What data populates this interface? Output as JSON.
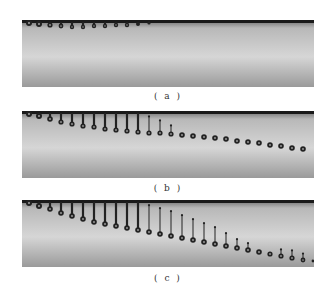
{
  "figure": {
    "panels": [
      {
        "id": "a",
        "caption": "( a )",
        "droplets": [
          {
            "x": 7,
            "tail": 0,
            "y": 3,
            "r": 3
          },
          {
            "x": 17,
            "tail": 0,
            "y": 4,
            "r": 3
          },
          {
            "x": 28,
            "tail": 2,
            "y": 5,
            "r": 2.6
          },
          {
            "x": 39,
            "tail": 3,
            "y": 6,
            "r": 2.4
          },
          {
            "x": 50,
            "tail": 4,
            "y": 7,
            "r": 2.2
          },
          {
            "x": 61,
            "tail": 3,
            "y": 7,
            "r": 2.2
          },
          {
            "x": 72,
            "tail": 3,
            "y": 6,
            "r": 2.2
          },
          {
            "x": 83,
            "tail": 2,
            "y": 6,
            "r": 2.2
          },
          {
            "x": 94,
            "tail": 2,
            "y": 5,
            "r": 2.2
          },
          {
            "x": 105,
            "tail": 1,
            "y": 5,
            "r": 2.2
          },
          {
            "x": 116,
            "tail": 0,
            "y": 4,
            "r": 2
          },
          {
            "x": 127,
            "tail": 0,
            "y": 3,
            "r": 1.6
          }
        ]
      },
      {
        "id": "b",
        "caption": "( b )",
        "droplets": [
          {
            "x": 7,
            "tail": 0,
            "y": 3,
            "r": 3
          },
          {
            "x": 17,
            "tail": 2,
            "y": 5,
            "r": 3
          },
          {
            "x": 28,
            "tail": 5,
            "y": 8,
            "r": 2.8
          },
          {
            "x": 39,
            "tail": 8,
            "y": 11,
            "r": 2.6
          },
          {
            "x": 50,
            "tail": 10,
            "y": 13,
            "r": 2.6
          },
          {
            "x": 61,
            "tail": 12,
            "y": 15,
            "r": 2.6
          },
          {
            "x": 72,
            "tail": 13,
            "y": 16,
            "r": 2.6
          },
          {
            "x": 83,
            "tail": 14,
            "y": 18,
            "r": 2.6
          },
          {
            "x": 94,
            "tail": 15,
            "y": 19,
            "r": 2.6
          },
          {
            "x": 105,
            "tail": 16,
            "y": 20,
            "r": 2.6
          },
          {
            "x": 116,
            "tail": 16,
            "y": 21,
            "r": 2.6
          },
          {
            "x": 127,
            "tail": 14,
            "y": 22,
            "r": 2.6,
            "detached": true
          },
          {
            "x": 138,
            "tail": 10,
            "y": 22,
            "r": 2.6,
            "detached": true
          },
          {
            "x": 149,
            "tail": 6,
            "y": 23,
            "r": 2.6,
            "detached": true
          },
          {
            "x": 160,
            "tail": 0,
            "y": 24,
            "r": 2.8
          },
          {
            "x": 171,
            "tail": 0,
            "y": 25,
            "r": 2.8
          },
          {
            "x": 182,
            "tail": 0,
            "y": 26,
            "r": 2.8
          },
          {
            "x": 193,
            "tail": 0,
            "y": 27,
            "r": 2.8
          },
          {
            "x": 204,
            "tail": 0,
            "y": 28,
            "r": 2.8
          },
          {
            "x": 215,
            "tail": 0,
            "y": 30,
            "r": 2.8
          },
          {
            "x": 226,
            "tail": 0,
            "y": 31,
            "r": 2.8
          },
          {
            "x": 237,
            "tail": 0,
            "y": 32,
            "r": 2.8
          },
          {
            "x": 248,
            "tail": 0,
            "y": 34,
            "r": 2.8
          },
          {
            "x": 259,
            "tail": 0,
            "y": 35,
            "r": 2.8
          },
          {
            "x": 270,
            "tail": 0,
            "y": 37,
            "r": 2.8
          },
          {
            "x": 281,
            "tail": 0,
            "y": 38,
            "r": 2.8
          }
        ]
      },
      {
        "id": "c",
        "caption": "( c )",
        "droplets": [
          {
            "x": 7,
            "tail": 0,
            "y": 3,
            "r": 3
          },
          {
            "x": 17,
            "tail": 2,
            "y": 6,
            "r": 3
          },
          {
            "x": 28,
            "tail": 6,
            "y": 9,
            "r": 2.8
          },
          {
            "x": 39,
            "tail": 10,
            "y": 13,
            "r": 2.8
          },
          {
            "x": 50,
            "tail": 13,
            "y": 16,
            "r": 2.8
          },
          {
            "x": 61,
            "tail": 16,
            "y": 19,
            "r": 2.8
          },
          {
            "x": 72,
            "tail": 18,
            "y": 22,
            "r": 2.8
          },
          {
            "x": 83,
            "tail": 20,
            "y": 24,
            "r": 2.8
          },
          {
            "x": 94,
            "tail": 22,
            "y": 26,
            "r": 2.8
          },
          {
            "x": 105,
            "tail": 24,
            "y": 28,
            "r": 2.8
          },
          {
            "x": 116,
            "tail": 26,
            "y": 30,
            "r": 2.8
          },
          {
            "x": 127,
            "tail": 24,
            "y": 32,
            "r": 2.8,
            "detached": true
          },
          {
            "x": 138,
            "tail": 23,
            "y": 34,
            "r": 2.8,
            "detached": true
          },
          {
            "x": 149,
            "tail": 22,
            "y": 36,
            "r": 2.8,
            "detached": true
          },
          {
            "x": 160,
            "tail": 20,
            "y": 38,
            "r": 2.8,
            "detached": true
          },
          {
            "x": 171,
            "tail": 18,
            "y": 40,
            "r": 2.8,
            "detached": true
          },
          {
            "x": 182,
            "tail": 16,
            "y": 42,
            "r": 2.8,
            "detached": true
          },
          {
            "x": 193,
            "tail": 14,
            "y": 44,
            "r": 2.8,
            "detached": true
          },
          {
            "x": 204,
            "tail": 10,
            "y": 46,
            "r": 2.8,
            "detached": true
          },
          {
            "x": 215,
            "tail": 6,
            "y": 48,
            "r": 2.8,
            "detached": true
          },
          {
            "x": 226,
            "tail": 4,
            "y": 50,
            "r": 2.8,
            "detached": true
          },
          {
            "x": 237,
            "tail": 0,
            "y": 52,
            "r": 2.8
          },
          {
            "x": 248,
            "tail": 0,
            "y": 54,
            "r": 2.6
          },
          {
            "x": 259,
            "tail": 4,
            "y": 56,
            "r": 2.6,
            "detached": true
          },
          {
            "x": 270,
            "tail": 5,
            "y": 58,
            "r": 2.6,
            "detached": true
          },
          {
            "x": 281,
            "tail": 4,
            "y": 60,
            "r": 2.4,
            "detached": true
          },
          {
            "x": 291,
            "tail": 0,
            "y": 61,
            "r": 1.4
          }
        ]
      }
    ],
    "colors": {
      "bg_top": "#6c6c6c",
      "bg_mid": "#d6d6d6",
      "bg_bottom": "#9a9a9a",
      "nozzle": "#1a1a1a",
      "droplet": "#222222",
      "droplet_highlight": "#9a9a9a"
    }
  }
}
